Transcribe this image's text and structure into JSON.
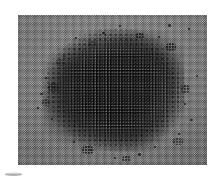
{
  "figure": {
    "kind": "grayscale-micrograph",
    "background_color": "#ffffff",
    "plate": {
      "x": 18,
      "y": 15,
      "width": 189,
      "height": 150,
      "substrate_color": "#b0b0b0",
      "lattice_dot_color": "#4c4c4c",
      "lattice_pitch_px": 2.3
    },
    "aggregate": {
      "particle_color": "#0d0d0d",
      "center_x_pct": 50,
      "center_y_pct": 49,
      "width_pct": 74,
      "height_pct": 83,
      "grain_pitch_px": 2.8
    },
    "scatter_specks": [
      {
        "x": 150,
        "y": 9,
        "w": 3,
        "h": 3
      },
      {
        "x": 101,
        "y": 10,
        "w": 2,
        "h": 2
      },
      {
        "x": 170,
        "y": 13,
        "w": 2,
        "h": 2
      },
      {
        "x": 57,
        "y": 22,
        "w": 2,
        "h": 2
      },
      {
        "x": 84,
        "y": 17,
        "w": 3,
        "h": 2
      },
      {
        "x": 140,
        "y": 21,
        "w": 2,
        "h": 2
      },
      {
        "x": 27,
        "y": 62,
        "w": 2,
        "h": 2
      },
      {
        "x": 22,
        "y": 78,
        "w": 3,
        "h": 2
      },
      {
        "x": 19,
        "y": 92,
        "w": 2,
        "h": 2
      },
      {
        "x": 33,
        "y": 103,
        "w": 2,
        "h": 2
      },
      {
        "x": 160,
        "y": 118,
        "w": 2,
        "h": 2
      },
      {
        "x": 172,
        "y": 104,
        "w": 3,
        "h": 2
      },
      {
        "x": 166,
        "y": 88,
        "w": 2,
        "h": 2
      },
      {
        "x": 120,
        "y": 138,
        "w": 3,
        "h": 3
      },
      {
        "x": 96,
        "y": 142,
        "w": 2,
        "h": 2
      },
      {
        "x": 72,
        "y": 134,
        "w": 2,
        "h": 2
      },
      {
        "x": 55,
        "y": 126,
        "w": 2,
        "h": 2
      },
      {
        "x": 136,
        "y": 131,
        "w": 2,
        "h": 2
      },
      {
        "x": 45,
        "y": 40,
        "w": 2,
        "h": 2
      },
      {
        "x": 178,
        "y": 60,
        "w": 2,
        "h": 2
      }
    ],
    "scatter_clumps": [
      {
        "x": 38,
        "y": 44,
        "w": 9,
        "h": 7
      },
      {
        "x": 30,
        "y": 68,
        "w": 11,
        "h": 9
      },
      {
        "x": 24,
        "y": 84,
        "w": 8,
        "h": 7
      },
      {
        "x": 148,
        "y": 28,
        "w": 10,
        "h": 8
      },
      {
        "x": 163,
        "y": 70,
        "w": 9,
        "h": 8
      },
      {
        "x": 155,
        "y": 123,
        "w": 10,
        "h": 7
      },
      {
        "x": 64,
        "y": 131,
        "w": 12,
        "h": 8
      },
      {
        "x": 104,
        "y": 141,
        "w": 9,
        "h": 6
      },
      {
        "x": 70,
        "y": 26,
        "w": 9,
        "h": 7
      },
      {
        "x": 118,
        "y": 18,
        "w": 8,
        "h": 6
      }
    ],
    "caption_remnant": {
      "visible": true,
      "description": "faint cut-off gray mark at lower-left"
    }
  }
}
